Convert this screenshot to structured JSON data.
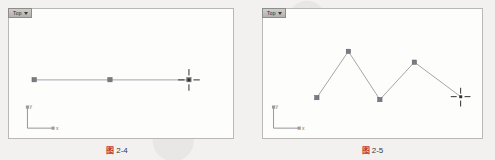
{
  "page": {
    "background_color": "#f2f1ef",
    "media": "scanned-textbook-page"
  },
  "figures": [
    {
      "id": "left",
      "viewport": {
        "label": "Top",
        "label_caret_icon": "chevron-down-icon",
        "background_color": "#fdfdfc",
        "border_color": "#b9b8b4"
      },
      "axis_tripod": {
        "x_label": "x",
        "y_label": "y",
        "color": "#8a8a8a"
      },
      "geometry": {
        "type": "polyline",
        "description": "single straight horizontal segment with three control vertices",
        "stroke_color": "#8d8d92",
        "vertex_color": "#6e6e74",
        "points": [
          {
            "x": 33,
            "y": 80
          },
          {
            "x": 110,
            "y": 80
          },
          {
            "x": 190,
            "y": 80
          }
        ]
      },
      "cursor": {
        "type": "crosshair-cursor",
        "x": 190,
        "y": 80,
        "color": "#2e2e33"
      },
      "caption": {
        "cjk": "图",
        "number": "2-4",
        "accent_color": "#c0392b"
      }
    },
    {
      "id": "right",
      "viewport": {
        "label": "Top",
        "label_caret_icon": "chevron-down-icon",
        "background_color": "#fdfdfc",
        "border_color": "#b9b8b4"
      },
      "axis_tripod": {
        "x_label": "x",
        "y_label": "y",
        "color": "#8a8a8a"
      },
      "geometry": {
        "type": "polyline",
        "description": "zigzag polyline with five control vertices forming two peaks",
        "stroke_color": "#8d8d92",
        "vertex_color": "#6e6e74",
        "points": [
          {
            "x": 316,
            "y": 98
          },
          {
            "x": 348,
            "y": 51
          },
          {
            "x": 380,
            "y": 100
          },
          {
            "x": 415,
            "y": 62
          },
          {
            "x": 465,
            "y": 97
          }
        ]
      },
      "cursor": {
        "type": "crosshair-cursor",
        "x": 465,
        "y": 97,
        "color": "#2e2e33"
      },
      "caption": {
        "cjk": "图",
        "number": "2-5",
        "accent_color": "#c0392b"
      }
    }
  ]
}
